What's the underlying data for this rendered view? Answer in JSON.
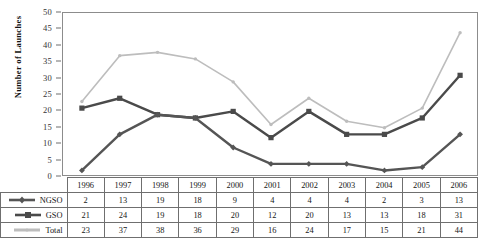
{
  "chart_data": {
    "type": "line",
    "title": "",
    "xlabel": "",
    "ylabel": "Number of Launches",
    "categories": [
      "1996",
      "1997",
      "1998",
      "1999",
      "2000",
      "2001",
      "2002",
      "2003",
      "2004",
      "2005",
      "2006"
    ],
    "ylim": [
      0,
      50
    ],
    "ytick_step": 5,
    "yticks": [
      0,
      5,
      10,
      15,
      20,
      25,
      30,
      35,
      40,
      45,
      50
    ],
    "grid": false,
    "legend_position": "table-first-column",
    "series": [
      {
        "name": "NGSO",
        "marker": "diamond",
        "color": "#555555",
        "values": [
          2,
          13,
          19,
          18,
          9,
          4,
          4,
          4,
          2,
          3,
          13
        ]
      },
      {
        "name": "GSO",
        "marker": "square",
        "color": "#4a4a4a",
        "values": [
          21,
          24,
          19,
          18,
          20,
          12,
          20,
          13,
          13,
          18,
          31
        ]
      },
      {
        "name": "Total",
        "marker": "dot",
        "color": "#bdbdbd",
        "values": [
          23,
          37,
          38,
          36,
          29,
          16,
          24,
          17,
          15,
          21,
          44
        ]
      }
    ]
  },
  "table": {
    "year_header": [
      "1996",
      "1997",
      "1998",
      "1999",
      "2000",
      "2001",
      "2002",
      "2003",
      "2004",
      "2005",
      "2006"
    ],
    "rows": [
      {
        "label": "NGSO",
        "values": [
          "2",
          "13",
          "19",
          "18",
          "9",
          "4",
          "4",
          "4",
          "2",
          "3",
          "13"
        ]
      },
      {
        "label": "GSO",
        "values": [
          "21",
          "24",
          "19",
          "18",
          "20",
          "12",
          "20",
          "13",
          "13",
          "18",
          "31"
        ]
      },
      {
        "label": "Total",
        "values": [
          "23",
          "37",
          "38",
          "36",
          "29",
          "16",
          "24",
          "17",
          "15",
          "21",
          "44"
        ]
      }
    ]
  },
  "colors": {
    "ngso": "#555555",
    "gso": "#4a4a4a",
    "total": "#bdbdbd",
    "axis": "#8c8c8c",
    "grid_border": "#6f6f6f",
    "background": "#ffffff"
  }
}
